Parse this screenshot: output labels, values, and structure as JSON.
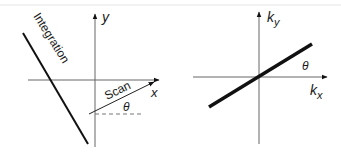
{
  "colors": {
    "background": "#ffffff",
    "axis": "#555555",
    "line": "#111111",
    "border": "#e0e0e0"
  },
  "left_panel": {
    "y_axis_label": "y",
    "x_axis_label": "x",
    "integration_label": "Integration",
    "scan_label": "Scan",
    "angle_label": "θ"
  },
  "right_panel": {
    "ky_label_main": "k",
    "ky_label_sub": "y",
    "kx_label_main": "k",
    "kx_label_sub": "x",
    "angle_label": "θ"
  }
}
